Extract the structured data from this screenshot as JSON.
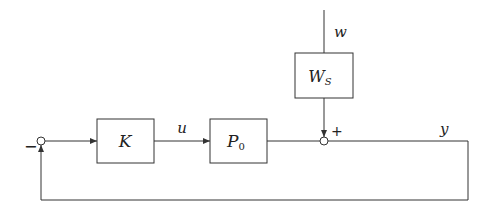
{
  "diagram": {
    "type": "feedback-block-diagram",
    "blocks": [
      {
        "id": "K",
        "label": "K",
        "sub": ""
      },
      {
        "id": "P0",
        "label": "P",
        "sub": "0"
      },
      {
        "id": "Ws",
        "label": "W",
        "sub": "S"
      }
    ],
    "signals": {
      "u": "u",
      "w": "w",
      "y": "y"
    },
    "summing_junctions": [
      {
        "id": "feedback-sum",
        "sign": "−"
      },
      {
        "id": "disturbance-sum",
        "sign": "+"
      }
    ],
    "colors": {
      "line": "#333333",
      "background": "#ffffff"
    }
  }
}
